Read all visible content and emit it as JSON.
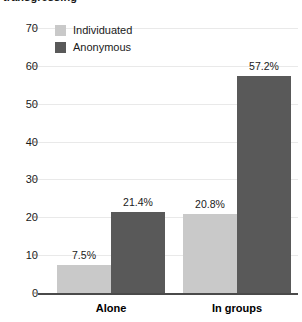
{
  "chart_data": {
    "type": "bar",
    "title": "transgressing",
    "xlabel": "",
    "ylabel": "",
    "ylim": [
      0,
      70
    ],
    "yticks": [
      0,
      10,
      20,
      30,
      40,
      50,
      60,
      70
    ],
    "ytick_labels": [
      "0",
      "10",
      "20",
      "30",
      "40",
      "50",
      "60",
      "70"
    ],
    "categories": [
      "Alone",
      "In groups"
    ],
    "grid": true,
    "legend_position": "top-left",
    "series": [
      {
        "name": "Individuated",
        "color": "#c9c9c9",
        "values": [
          7.5,
          20.8
        ],
        "labels": [
          "7.5%",
          "20.8%"
        ]
      },
      {
        "name": "Anonymous",
        "color": "#595959",
        "values": [
          21.4,
          57.2
        ],
        "labels": [
          "21.4%",
          "57.2%"
        ]
      }
    ]
  },
  "colors": {
    "individuated": "#c9c9c9",
    "anonymous": "#595959",
    "gridline": "#e9e9e9",
    "axis": "#4a4a4a",
    "text": "#1a1a1a",
    "background": "#ffffff"
  }
}
